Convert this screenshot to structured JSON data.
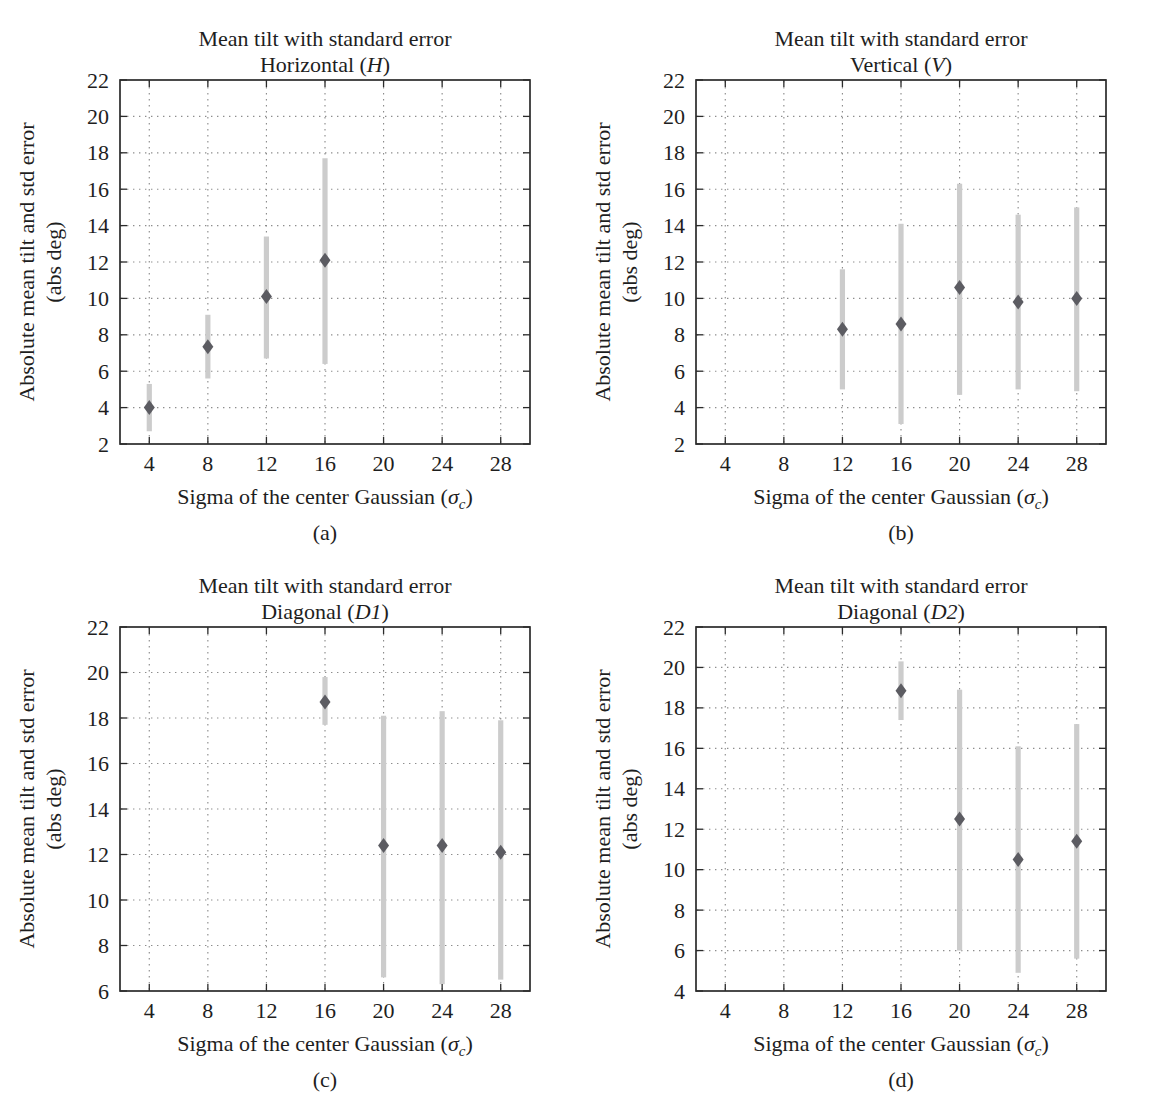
{
  "page": {
    "background": "#ffffff"
  },
  "colors": {
    "marker": "#5c5c62",
    "error_bar": "#cccccc",
    "grid": "#8d8d8d",
    "axis": "#2b2b2b",
    "text": "#1e1e1e"
  },
  "figure": {
    "ylabel_line1": "Absolute mean tilt and std error",
    "ylabel_line2": "(abs deg)",
    "xlabel_pre": "Sigma of the center Gaussian (",
    "xlabel_sigma": "σ",
    "xlabel_subscript": "c",
    "xlabel_post": ")"
  },
  "chart_data": [
    {
      "type": "scatter",
      "title": "Mean tilt with standard error",
      "subtitle_pre": "Horizontal (",
      "subtitle_italic": "H",
      "subtitle_post": ")",
      "panel_label": "(a)",
      "xlabel": "Sigma of the center Gaussian (σc)",
      "ylabel": "Absolute mean tilt and std error (abs deg)",
      "xlim": [
        2,
        30
      ],
      "ylim": [
        2,
        22
      ],
      "xticks": [
        4,
        8,
        12,
        16,
        20,
        24,
        28
      ],
      "yticks": [
        2,
        4,
        6,
        8,
        10,
        12,
        14,
        16,
        18,
        20,
        22
      ],
      "grid": true,
      "points": [
        {
          "x": 4,
          "y": 4.0,
          "err_lo": 2.7,
          "err_hi": 5.3
        },
        {
          "x": 8,
          "y": 7.35,
          "err_lo": 5.6,
          "err_hi": 9.1
        },
        {
          "x": 12,
          "y": 10.1,
          "err_lo": 6.7,
          "err_hi": 13.4
        },
        {
          "x": 16,
          "y": 12.1,
          "err_lo": 6.4,
          "err_hi": 17.7
        }
      ]
    },
    {
      "type": "scatter",
      "title": "Mean tilt with standard error",
      "subtitle_pre": "Vertical (",
      "subtitle_italic": "V",
      "subtitle_post": ")",
      "panel_label": "(b)",
      "xlabel": "Sigma of the center Gaussian (σc)",
      "ylabel": "Absolute mean tilt and std error (abs deg)",
      "xlim": [
        2,
        30
      ],
      "ylim": [
        2,
        22
      ],
      "xticks": [
        4,
        8,
        12,
        16,
        20,
        24,
        28
      ],
      "yticks": [
        2,
        4,
        6,
        8,
        10,
        12,
        14,
        16,
        18,
        20,
        22
      ],
      "grid": true,
      "points": [
        {
          "x": 12,
          "y": 8.3,
          "err_lo": 5.0,
          "err_hi": 11.6
        },
        {
          "x": 16,
          "y": 8.6,
          "err_lo": 3.1,
          "err_hi": 14.1
        },
        {
          "x": 20,
          "y": 10.6,
          "err_lo": 4.7,
          "err_hi": 16.3
        },
        {
          "x": 24,
          "y": 9.8,
          "err_lo": 5.0,
          "err_hi": 14.6
        },
        {
          "x": 28,
          "y": 10.0,
          "err_lo": 4.9,
          "err_hi": 15.0
        }
      ]
    },
    {
      "type": "scatter",
      "title": "Mean tilt with standard error",
      "subtitle_pre": "Diagonal (",
      "subtitle_italic": "D1",
      "subtitle_post": ")",
      "panel_label": "(c)",
      "xlabel": "Sigma of the center Gaussian (σc)",
      "ylabel": "Absolute mean tilt and std error (abs deg)",
      "xlim": [
        2,
        30
      ],
      "ylim": [
        6,
        22
      ],
      "xticks": [
        4,
        8,
        12,
        16,
        20,
        24,
        28
      ],
      "yticks": [
        6,
        8,
        10,
        12,
        14,
        16,
        18,
        20,
        22
      ],
      "grid": true,
      "points": [
        {
          "x": 16,
          "y": 18.7,
          "err_lo": 17.7,
          "err_hi": 19.8
        },
        {
          "x": 20,
          "y": 12.4,
          "err_lo": 6.6,
          "err_hi": 18.1
        },
        {
          "x": 24,
          "y": 12.4,
          "err_lo": 6.3,
          "err_hi": 18.3
        },
        {
          "x": 28,
          "y": 12.1,
          "err_lo": 6.5,
          "err_hi": 17.9
        }
      ]
    },
    {
      "type": "scatter",
      "title": "Mean tilt with standard error",
      "subtitle_pre": "Diagonal (",
      "subtitle_italic": "D2",
      "subtitle_post": ")",
      "panel_label": "(d)",
      "xlabel": "Sigma of the center Gaussian (σc)",
      "ylabel": "Absolute mean tilt and std error (abs deg)",
      "xlim": [
        2,
        30
      ],
      "ylim": [
        4,
        22
      ],
      "xticks": [
        4,
        8,
        12,
        16,
        20,
        24,
        28
      ],
      "yticks": [
        4,
        6,
        8,
        10,
        12,
        14,
        16,
        18,
        20,
        22
      ],
      "grid": true,
      "points": [
        {
          "x": 16,
          "y": 18.85,
          "err_lo": 17.4,
          "err_hi": 20.3
        },
        {
          "x": 20,
          "y": 12.5,
          "err_lo": 6.0,
          "err_hi": 18.9
        },
        {
          "x": 24,
          "y": 10.5,
          "err_lo": 4.9,
          "err_hi": 16.1
        },
        {
          "x": 28,
          "y": 11.4,
          "err_lo": 5.6,
          "err_hi": 17.2
        }
      ]
    }
  ]
}
